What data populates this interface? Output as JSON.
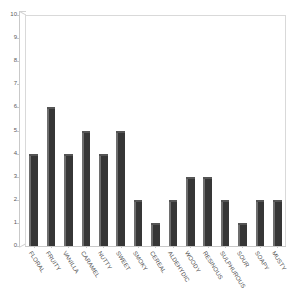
{
  "chart_data": {
    "type": "bar",
    "title": "",
    "subtitle": "",
    "xlabel": "",
    "ylabel": "",
    "ylim": [
      0,
      10
    ],
    "ytick_labels": [
      "0",
      "1",
      "2",
      "3",
      "4",
      "5",
      "6",
      "7",
      "8",
      "9",
      "10"
    ],
    "ytick_values": [
      0,
      1,
      2,
      3,
      4,
      5,
      6,
      7,
      8,
      9,
      10
    ],
    "grid": false,
    "legend": false,
    "legend_position": "none",
    "bar_color": "#363636",
    "categories": [
      "FLORAL",
      "FRUITY",
      "VANILLA",
      "CARAMEL",
      "NUTTY",
      "SWEET",
      "SMOKY",
      "CEREAL",
      "ALDEHYDIC",
      "WOODY",
      "RESINOUS",
      "SULPHUROUS",
      "SOUR",
      "SOAPY",
      "MUSTY"
    ],
    "values": [
      4,
      6,
      4,
      5,
      4,
      5,
      2,
      1,
      2,
      3,
      3,
      2,
      1,
      2,
      2
    ]
  },
  "colors": {
    "bar_front": "#363636",
    "bar_highlight": "#6e6e6e",
    "bar_top": "#555555",
    "axis": "#c9c9c9",
    "wall": "#d9d9d9",
    "tick_text": "#5a5a5a",
    "category_text": "#4d4d4d",
    "background": "#ffffff"
  }
}
